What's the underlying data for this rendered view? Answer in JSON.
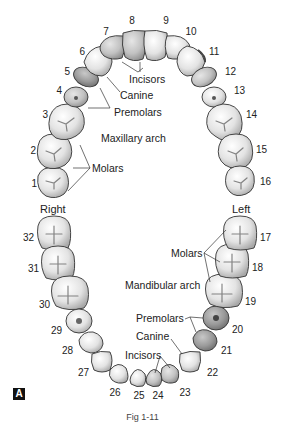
{
  "figure": {
    "panel_label": "A",
    "caption": "Fig 1-11",
    "side_labels": {
      "right": "Right",
      "left": "Left"
    },
    "arches": {
      "maxillary": {
        "title": "Maxillary arch",
        "groups": {
          "incisors": "Incisors",
          "canine": "Canine",
          "premolars": "Premolars",
          "molars": "Molars"
        },
        "teeth": [
          {
            "n": "1",
            "type": "molar"
          },
          {
            "n": "2",
            "type": "molar"
          },
          {
            "n": "3",
            "type": "molar"
          },
          {
            "n": "4",
            "type": "premolar"
          },
          {
            "n": "5",
            "type": "premolar"
          },
          {
            "n": "6",
            "type": "canine"
          },
          {
            "n": "7",
            "type": "incisor"
          },
          {
            "n": "8",
            "type": "incisor"
          },
          {
            "n": "9",
            "type": "incisor"
          },
          {
            "n": "10",
            "type": "incisor"
          },
          {
            "n": "11",
            "type": "canine"
          },
          {
            "n": "12",
            "type": "premolar"
          },
          {
            "n": "13",
            "type": "premolar"
          },
          {
            "n": "14",
            "type": "molar"
          },
          {
            "n": "15",
            "type": "molar"
          },
          {
            "n": "16",
            "type": "molar"
          }
        ]
      },
      "mandibular": {
        "title": "Mandibular arch",
        "groups": {
          "incisors": "Incisors",
          "canine": "Canine",
          "premolars": "Premolars",
          "molars": "Molars"
        },
        "teeth": [
          {
            "n": "17",
            "type": "molar"
          },
          {
            "n": "18",
            "type": "molar"
          },
          {
            "n": "19",
            "type": "molar"
          },
          {
            "n": "20",
            "type": "premolar"
          },
          {
            "n": "21",
            "type": "premolar"
          },
          {
            "n": "22",
            "type": "canine"
          },
          {
            "n": "23",
            "type": "incisor"
          },
          {
            "n": "24",
            "type": "incisor"
          },
          {
            "n": "25",
            "type": "incisor"
          },
          {
            "n": "26",
            "type": "incisor"
          },
          {
            "n": "27",
            "type": "canine"
          },
          {
            "n": "28",
            "type": "premolar"
          },
          {
            "n": "29",
            "type": "premolar"
          },
          {
            "n": "30",
            "type": "molar"
          },
          {
            "n": "31",
            "type": "molar"
          },
          {
            "n": "32",
            "type": "molar"
          }
        ]
      }
    },
    "colors": {
      "molar": "#d9d9d9",
      "incisor_highlight": "#c4c4c4",
      "canine_highlight": "#b8b8b8",
      "premolar_highlight": "#9e9e9e",
      "outline": "#333333"
    }
  }
}
